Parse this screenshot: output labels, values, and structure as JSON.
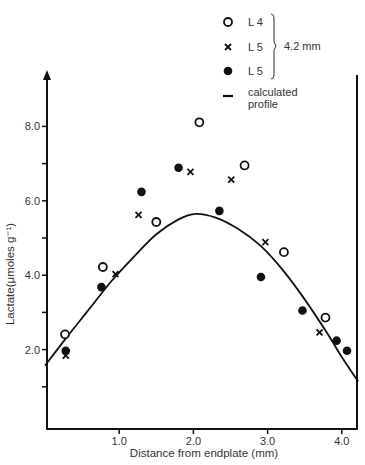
{
  "chart_data": {
    "type": "scatter",
    "title": "",
    "xlabel": "Distance from endplate (mm)",
    "ylabel": "Lactate(μmoles g⁻¹)",
    "xlim": [
      0,
      4.22
    ],
    "ylim": [
      0,
      8.8
    ],
    "x_ticks": [
      {
        "value": 1.0,
        "label": "1.0"
      },
      {
        "value": 2.0,
        "label": "2.0"
      },
      {
        "value": 3.0,
        "label": "3.0"
      },
      {
        "value": 4.0,
        "label": "4.0"
      }
    ],
    "y_ticks": [
      {
        "value": 1.0,
        "label": ""
      },
      {
        "value": 2.0,
        "label": "2.0"
      },
      {
        "value": 3.0,
        "label": ""
      },
      {
        "value": 4.0,
        "label": "4.0"
      },
      {
        "value": 5.0,
        "label": ""
      },
      {
        "value": 6.0,
        "label": "6.0"
      },
      {
        "value": 7.0,
        "label": ""
      },
      {
        "value": 8.0,
        "label": "8.0"
      }
    ],
    "grid": false,
    "legend_position": "top-right",
    "legend": {
      "entries": [
        {
          "marker": "open-circle",
          "label": "L 4"
        },
        {
          "marker": "cross",
          "label": "L 5"
        },
        {
          "marker": "filled-circle",
          "label": "L 5"
        },
        {
          "marker": "line",
          "label": "calculated profile"
        }
      ],
      "bracket_label": "4.2 mm"
    },
    "series": [
      {
        "name": "L 4",
        "marker": "open-circle",
        "points": [
          [
            0.27,
            2.41
          ],
          [
            0.78,
            4.22
          ],
          [
            1.5,
            5.43
          ],
          [
            2.08,
            8.11
          ],
          [
            2.69,
            6.95
          ],
          [
            3.22,
            4.62
          ],
          [
            3.78,
            2.86
          ]
        ]
      },
      {
        "name": "L 5 (cross)",
        "marker": "cross",
        "points": [
          [
            0.28,
            1.84
          ],
          [
            0.95,
            4.03
          ],
          [
            1.26,
            5.62
          ],
          [
            1.96,
            6.78
          ],
          [
            2.51,
            6.57
          ],
          [
            2.97,
            4.89
          ],
          [
            3.7,
            2.46
          ]
        ]
      },
      {
        "name": "L 5 (filled)",
        "marker": "filled-circle",
        "points": [
          [
            0.28,
            1.97
          ],
          [
            0.76,
            3.68
          ],
          [
            1.3,
            6.24
          ],
          [
            1.8,
            6.89
          ],
          [
            2.35,
            5.73
          ],
          [
            2.91,
            3.95
          ],
          [
            3.47,
            3.05
          ],
          [
            3.93,
            2.24
          ],
          [
            4.07,
            1.97
          ]
        ]
      },
      {
        "name": "calculated profile",
        "marker": "line",
        "points": [
          [
            0.0,
            1.57
          ],
          [
            0.3,
            2.35
          ],
          [
            0.6,
            3.1
          ],
          [
            0.9,
            3.85
          ],
          [
            1.2,
            4.5
          ],
          [
            1.5,
            5.1
          ],
          [
            1.8,
            5.5
          ],
          [
            2.03,
            5.65
          ],
          [
            2.3,
            5.55
          ],
          [
            2.6,
            5.25
          ],
          [
            2.9,
            4.8
          ],
          [
            3.2,
            4.15
          ],
          [
            3.5,
            3.35
          ],
          [
            3.8,
            2.45
          ],
          [
            4.0,
            1.8
          ],
          [
            4.22,
            1.14
          ]
        ]
      }
    ]
  }
}
